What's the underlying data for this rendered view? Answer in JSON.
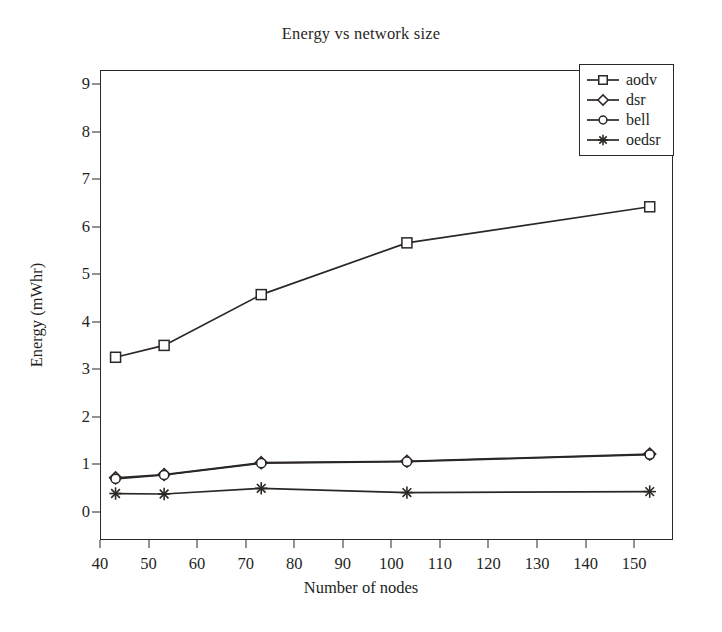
{
  "chart_data": {
    "type": "line",
    "title": "Energy vs network size",
    "xlabel": "Number of nodes",
    "ylabel": "Energy (mWhr)",
    "xlim": [
      40,
      158
    ],
    "ylim": [
      -0.6,
      9.3
    ],
    "xticks": [
      40,
      50,
      60,
      70,
      80,
      90,
      100,
      110,
      120,
      130,
      140,
      150
    ],
    "yticks": [
      0,
      1,
      2,
      3,
      4,
      5,
      6,
      7,
      8,
      9
    ],
    "grid": false,
    "legend_position": "top-right",
    "x": [
      43,
      53,
      73,
      103,
      153
    ],
    "series": [
      {
        "name": "aodv",
        "marker": "square",
        "values": [
          3.27,
          3.52,
          4.59,
          5.68,
          6.44
        ]
      },
      {
        "name": "dsr",
        "marker": "diamond",
        "values": [
          0.73,
          0.8,
          1.05,
          1.08,
          1.23
        ]
      },
      {
        "name": "bell",
        "marker": "circle",
        "values": [
          0.71,
          0.79,
          1.04,
          1.07,
          1.22
        ]
      },
      {
        "name": "oedsr",
        "marker": "asterisk",
        "values": [
          0.4,
          0.39,
          0.51,
          0.42,
          0.44
        ]
      }
    ]
  },
  "legend": {
    "items": [
      {
        "label": "aodv",
        "marker": "square"
      },
      {
        "label": "dsr",
        "marker": "diamond"
      },
      {
        "label": "bell",
        "marker": "circle"
      },
      {
        "label": "oedsr",
        "marker": "asterisk"
      }
    ]
  },
  "colors": {
    "ink": "#2b2725",
    "background": "#ffffff"
  }
}
